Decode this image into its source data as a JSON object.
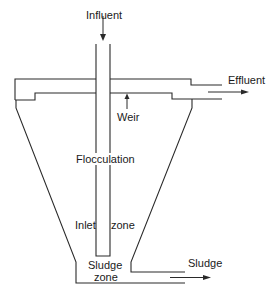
{
  "diagram": {
    "type": "clarifier-cross-section",
    "labels": {
      "influent": "Influent",
      "effluent": "Effluent",
      "weir": "Weir",
      "flocculation": "Flocculation",
      "inlet": "Inlet",
      "zone": "zone",
      "sludge_zone_line1": "Sludge",
      "sludge_zone_line2": "zone",
      "sludge_out": "Sludge"
    },
    "colors": {
      "line": "#2a2a2a",
      "background": "#ffffff"
    }
  }
}
